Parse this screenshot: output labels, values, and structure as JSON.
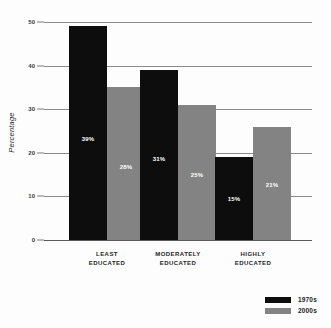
{
  "chart_data": {
    "type": "bar",
    "title": "",
    "xlabel": "",
    "ylabel": "Percentage",
    "ylim": [
      0,
      50
    ],
    "yticks": [
      0,
      10,
      20,
      30,
      40,
      50
    ],
    "grid": true,
    "legend_position": "bottom-right",
    "categories": [
      "LEAST EDUCATED",
      "MODERATELY EDUCATED",
      "HIGHLY EDUCATED"
    ],
    "series": [
      {
        "name": "1970s",
        "color": "#0d0d0d",
        "values": [
          49,
          39,
          19
        ],
        "labels": [
          "39%",
          "31%",
          "15%"
        ]
      },
      {
        "name": "2000s",
        "color": "#838383",
        "values": [
          35,
          31,
          26
        ],
        "labels": [
          "28%",
          "25%",
          "21%"
        ]
      }
    ]
  }
}
